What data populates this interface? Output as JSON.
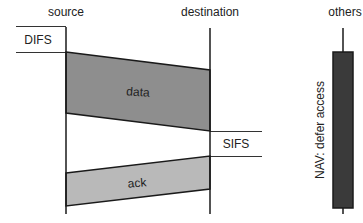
{
  "diagram": {
    "columns": {
      "source": "source",
      "destination": "destination",
      "others": "others"
    },
    "labels": {
      "difs": "DIFS",
      "sifs": "SIFS",
      "data": "data",
      "ack": "ack",
      "nav": "NAV: defer access"
    },
    "colors": {
      "data_fill": "#8e8e8e",
      "ack_fill": "#b9b9b9",
      "nav_fill": "#3a3a3a",
      "line": "#1a1a1a"
    }
  }
}
